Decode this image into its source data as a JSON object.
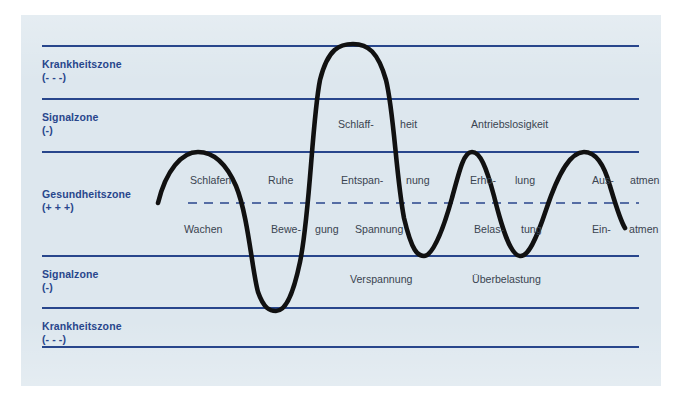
{
  "figure": {
    "background_color": "#dde7ee",
    "line_color": "#28468c",
    "curve_color": "#111111",
    "text_color": "#3a4450"
  },
  "zones": [
    {
      "name": "Krankheitszone",
      "sign": "(- - -)",
      "position": "top"
    },
    {
      "name": "Signalzone",
      "sign": "(-)",
      "position": "upper-middle"
    },
    {
      "name": "Gesundheitszone",
      "sign": "(+ + +)",
      "position": "center"
    },
    {
      "name": "Signalzone",
      "sign": "(-)",
      "position": "lower-middle"
    },
    {
      "name": "Krankheitszone",
      "sign": "(- - -)",
      "position": "bottom"
    }
  ],
  "curve_labels": {
    "upper_signal_row": [
      {
        "text": "Schlaff-",
        "x": 338,
        "y": 126
      },
      {
        "text": "heit",
        "x": 400,
        "y": 126
      },
      {
        "text": "Antriebslosigkeit",
        "x": 471,
        "y": 126
      }
    ],
    "upper_health_row": [
      {
        "text": "Schlafen",
        "x": 190,
        "y": 182
      },
      {
        "text": "Ruhe",
        "x": 268,
        "y": 182
      },
      {
        "text": "Entspan-",
        "x": 341,
        "y": 182
      },
      {
        "text": "nung",
        "x": 406,
        "y": 182
      },
      {
        "text": "Erho-",
        "x": 470,
        "y": 182
      },
      {
        "text": "lung",
        "x": 515,
        "y": 182
      },
      {
        "text": "Aus-",
        "x": 592,
        "y": 182
      },
      {
        "text": "atmen",
        "x": 630,
        "y": 182
      }
    ],
    "lower_health_row": [
      {
        "text": "Wachen",
        "x": 184,
        "y": 231
      },
      {
        "text": "Bewe-",
        "x": 271,
        "y": 231
      },
      {
        "text": "gung",
        "x": 315,
        "y": 231
      },
      {
        "text": "Spannung",
        "x": 355,
        "y": 231
      },
      {
        "text": "Belas-",
        "x": 474,
        "y": 231
      },
      {
        "text": "tung",
        "x": 521,
        "y": 231
      },
      {
        "text": "Ein-",
        "x": 592,
        "y": 231
      },
      {
        "text": "atmen",
        "x": 629,
        "y": 231
      }
    ],
    "lower_signal_row": [
      {
        "text": "Verspannung",
        "x": 350,
        "y": 281
      },
      {
        "text": "Überbelastung",
        "x": 472,
        "y": 281
      }
    ]
  },
  "chart_data": {
    "type": "line",
    "xlabel": "",
    "ylabel": "",
    "grid": true,
    "legend_position": "none",
    "zone_boundaries_y": [
      46,
      99,
      152,
      256,
      308,
      347
    ],
    "midline_y": 203,
    "midline_style": "dashed",
    "curve_path": "M 158 203 C 166 170 182 152 198 152 C 214 152 226 163 236 186 C 248 215 252 270 258 292 C 264 309 270 311 276 311 C 284 311 292 300 300 262 C 310 214 312 120 320 80 C 328 48 340 44 353 44 C 368 44 378 52 386 80 C 394 112 396 176 404 218 C 412 252 418 256 424 256 C 432 256 442 234 452 198 C 460 168 464 152 472 152 C 480 152 486 166 494 196 C 502 228 510 255 520 256 C 528 257 536 240 546 210 C 560 168 572 152 584 152 C 596 152 604 164 610 186 C 616 206 620 220 625 228",
    "curve_description": "Vertikale Schwingung, die zwischen Gesundheitszone, Signalzone und Krankheitszone pendelt",
    "extrema": [
      {
        "label": "Start",
        "x": 158,
        "y": 203,
        "zone": "Gesundheitszone"
      },
      {
        "label": "Schlafen-Gipfel",
        "x": 198,
        "y": 152,
        "zone": "Gesundheitszone"
      },
      {
        "label": "Tief Verspannung",
        "x": 276,
        "y": 311,
        "zone": "Krankheitszone"
      },
      {
        "label": "Gipfel Schlaffheit",
        "x": 353,
        "y": 44,
        "zone": "Krankheitszone"
      },
      {
        "label": "Tief Überbelastung",
        "x": 424,
        "y": 256,
        "zone": "Signalzone"
      },
      {
        "label": "Gipfel Erholung",
        "x": 472,
        "y": 152,
        "zone": "Gesundheitszone"
      },
      {
        "label": "Tief Belastung",
        "x": 520,
        "y": 256,
        "zone": "Signalzone"
      },
      {
        "label": "Gipfel Ausatmen",
        "x": 584,
        "y": 152,
        "zone": "Gesundheitszone"
      },
      {
        "label": "Ende Einatmen",
        "x": 625,
        "y": 228,
        "zone": "Gesundheitszone"
      }
    ]
  }
}
